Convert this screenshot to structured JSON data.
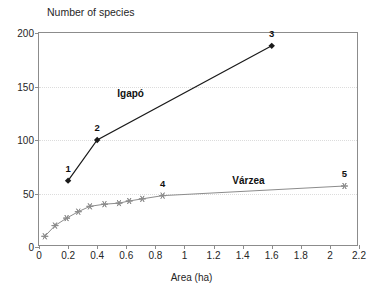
{
  "chart_data": {
    "type": "line",
    "title": "",
    "ylabel": "Number of species",
    "xlabel": "Area (ha)",
    "xlim": [
      0,
      2.2
    ],
    "ylim": [
      0,
      200
    ],
    "xticks": [
      "0",
      "0.2",
      "0.4",
      "0.6",
      "0.8",
      "1",
      "1.2",
      "1.4",
      "1.6",
      "1.8",
      "2",
      "2.2"
    ],
    "xtick_values": [
      0,
      0.2,
      0.4,
      0.6,
      0.8,
      1,
      1.2,
      1.4,
      1.6,
      1.8,
      2,
      2.2
    ],
    "yticks": [
      "0",
      "50",
      "100",
      "150",
      "200"
    ],
    "ytick_values": [
      0,
      50,
      100,
      150,
      200
    ],
    "grid": "horizontal-dotted",
    "gridlines": [
      50,
      100,
      150
    ],
    "legend_position": "inline-annotations",
    "series": [
      {
        "name": "Igapó",
        "color": "#1a1a1a",
        "marker": "filled-diamond",
        "x": [
          0.2,
          0.4,
          1.6
        ],
        "y": [
          62,
          100,
          188
        ],
        "point_labels": [
          "1",
          "2",
          "3"
        ],
        "label_text": "Igapó"
      },
      {
        "name": "Várzea",
        "color": "#8c8c8c",
        "marker": "star",
        "x": [
          0.04,
          0.11,
          0.19,
          0.27,
          0.35,
          0.45,
          0.55,
          0.62,
          0.71,
          0.85,
          2.1
        ],
        "y": [
          10,
          20,
          27,
          33,
          38,
          40,
          41,
          43,
          45,
          48,
          57
        ],
        "point_labels": [
          "",
          "",
          "",
          "",
          "",
          "",
          "",
          "",
          "",
          "4",
          "5"
        ],
        "label_text": "Várzea"
      }
    ],
    "annotations": [
      {
        "text": "Igapó",
        "x": 0.63,
        "y": 144
      },
      {
        "text": "Várzea",
        "x": 1.44,
        "y": 63
      }
    ]
  }
}
